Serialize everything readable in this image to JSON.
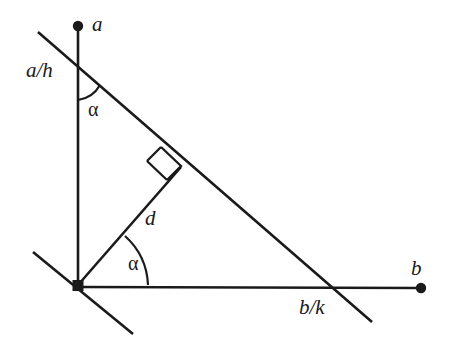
{
  "figure": {
    "stroke_color": "#1a1a1a",
    "background_color": "#ffffff"
  },
  "labels": {
    "vertex_a": "a",
    "line_a_over_h": "a/h",
    "angle_upper": "α",
    "distance_d": "d",
    "angle_lower": "α",
    "vertex_b": "b",
    "line_b_over_k": "b/k"
  },
  "icons": {
    "dot_a": "filled-circle-marker",
    "dot_b": "filled-circle-marker",
    "origin": "filled-square-marker",
    "right_angle": "right-angle-square-mark",
    "arc_upper": "angle-arc",
    "arc_lower": "angle-arc"
  },
  "geometry": {
    "origin": {
      "x": 78,
      "y": 285
    },
    "vertex_a": {
      "x": 78,
      "y": 26
    },
    "vertex_b": {
      "x": 422,
      "y": 288
    },
    "hypotenuse": {
      "x1": 38,
      "y1": 32,
      "x2": 372,
      "y2": 322
    },
    "axis_vertical": {
      "x1": 78,
      "y1": 26,
      "x2": 78,
      "y2": 287
    },
    "axis_horizontal": {
      "x1": 78,
      "y1": 287,
      "x2": 422,
      "y2": 288
    },
    "segment_d": {
      "x1": 78,
      "y1": 285,
      "x2": 181,
      "y2": 166
    },
    "perpendicular_line": {
      "x1": 33,
      "y1": 252,
      "x2": 133,
      "y2": 334
    },
    "foot_of_altitude": {
      "x": 181,
      "y": 166
    },
    "angle_upper_degrees": 41,
    "angle_lower_degrees": 49
  }
}
